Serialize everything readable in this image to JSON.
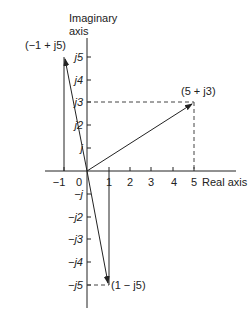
{
  "axes": {
    "imag_label_line1": "Imaginary",
    "imag_label_line2": "axis",
    "real_label": "Real axis",
    "real_ticks": [
      "−1",
      "0",
      "1",
      "2",
      "3",
      "4",
      "5"
    ],
    "imag_ticks_pos": [
      "j",
      "j2",
      "j3",
      "j4",
      "j5"
    ],
    "imag_ticks_neg": [
      "−j",
      "−j2",
      "−j3",
      "−j4",
      "−j5"
    ]
  },
  "points": [
    {
      "label": "(−1 + j5)",
      "re": -1,
      "im": 5
    },
    {
      "label": "(5 + j3)",
      "re": 5,
      "im": 3
    },
    {
      "label": "(1 − j5)",
      "re": 1,
      "im": -5
    }
  ]
}
